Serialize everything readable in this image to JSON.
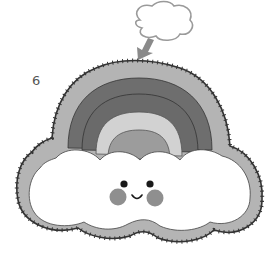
{
  "step": {
    "number": "6"
  },
  "illustration": {
    "subject": "felt rainbow cloud plush with blanket-stitch edge",
    "colors": {
      "outline_stitch": "#333333",
      "border_felt": "#b4b4b4",
      "band_outer": "#bdbdbd",
      "band_dark1": "#6e6e6e",
      "band_dark2": "#6a6a6a",
      "band_light": "#d2d2d2",
      "band_inner": "#9c9c9c",
      "cloud": "#ffffff",
      "cheeks": "#8f8f8f",
      "eyes": "#1a1a1a",
      "arrow": "#8a8a8a",
      "thought_cloud_outline": "#9a9a9a"
    }
  }
}
